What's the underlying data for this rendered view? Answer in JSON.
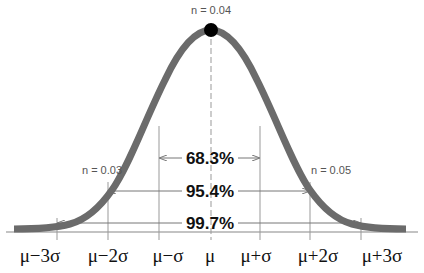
{
  "diagram": {
    "curve_color": "#6b6b6b",
    "peak_dot_color": "#000000",
    "annotations": {
      "peak": "n = 0.04",
      "left": "n = 0.03",
      "right": "n = 0.05"
    },
    "intervals": [
      {
        "label": "68.3%",
        "from": "μ−σ",
        "to": "μ+σ"
      },
      {
        "label": "95.4%",
        "from": "μ−2σ",
        "to": "μ+2σ"
      },
      {
        "label": "99.7%",
        "from": "μ−3σ",
        "to": "μ+3σ"
      }
    ],
    "x_ticks": [
      "μ−3σ",
      "μ−2σ",
      "μ−σ",
      "μ",
      "μ+σ",
      "μ+2σ",
      "μ+3σ"
    ]
  }
}
